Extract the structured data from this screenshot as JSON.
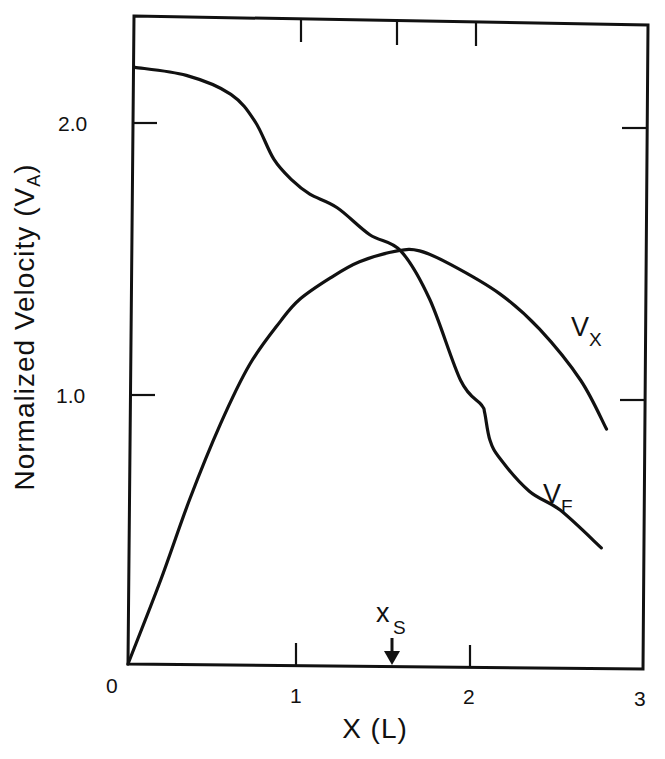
{
  "chart_data": {
    "type": "line",
    "title": "",
    "xlabel": "X (L)",
    "ylabel": "Normalized Velocity (V_A)",
    "xlim": [
      0,
      3
    ],
    "ylim": [
      0,
      2.4
    ],
    "x_ticks": [
      0,
      1,
      2,
      3
    ],
    "x_tick_labels": [
      "0",
      "1",
      "2",
      "3"
    ],
    "y_ticks": [
      1.0,
      2.0
    ],
    "y_tick_labels": [
      "1.0",
      "2.0"
    ],
    "grid": false,
    "legend": "inline labels",
    "series": [
      {
        "name": "V_F",
        "label_main": "V",
        "label_sub": "F",
        "x": [
          0.04,
          0.34,
          0.6,
          0.74,
          0.85,
          0.96,
          1.06,
          1.22,
          1.41,
          1.59,
          1.76,
          1.94,
          2.06,
          2.08,
          2.11,
          2.17,
          2.34,
          2.52,
          2.76
        ],
        "y": [
          2.21,
          2.18,
          2.11,
          2.01,
          1.87,
          1.79,
          1.74,
          1.69,
          1.59,
          1.53,
          1.35,
          1.05,
          0.96,
          0.93,
          0.83,
          0.76,
          0.64,
          0.57,
          0.43
        ]
      },
      {
        "name": "V_X",
        "label_main": "V",
        "label_sub": "X",
        "x": [
          0.0,
          0.19,
          0.36,
          0.54,
          0.71,
          0.89,
          1.0,
          1.18,
          1.35,
          1.57,
          1.7,
          1.88,
          2.17,
          2.4,
          2.64,
          2.79
        ],
        "y": [
          0.0,
          0.31,
          0.61,
          0.89,
          1.11,
          1.27,
          1.35,
          1.43,
          1.49,
          1.53,
          1.53,
          1.48,
          1.37,
          1.24,
          1.05,
          0.87
        ]
      }
    ],
    "annotations": [
      {
        "text_main": "x",
        "text_sub": "S",
        "x": 1.54,
        "type": "down-arrow-marker"
      }
    ]
  },
  "labels": {
    "x_axis_title": "X (L)",
    "y_axis_title_main": "Normalized Velocity (V",
    "y_axis_title_sub": "A",
    "y_axis_title_end": ")",
    "vx_main": "V",
    "vx_sub": "X",
    "vf_main": "V",
    "vf_sub": "F",
    "xs_main": "x",
    "xs_sub": "S",
    "tick_x0": "0",
    "tick_x1": "1",
    "tick_x2": "2",
    "tick_x3": "3",
    "tick_y1": "1.0",
    "tick_y2": "2.0"
  }
}
